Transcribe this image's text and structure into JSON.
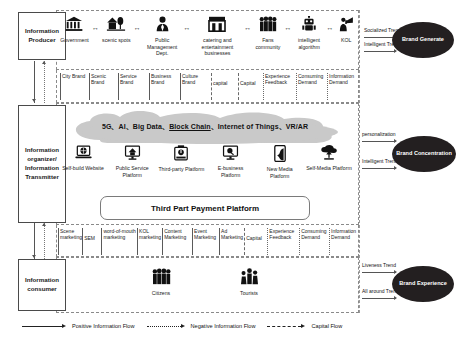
{
  "roles": {
    "producer": "Information Producer",
    "transmitter": "Information organizer/ Information Transmitter",
    "consumer": "Information consumer"
  },
  "producers": [
    {
      "label": "Government",
      "icon": "bank-icon",
      "glyph": "🏛"
    },
    {
      "label": "scenic spots",
      "icon": "park-icon",
      "glyph": "🏡"
    },
    {
      "label": "Public Management Dept.",
      "icon": "official-person-icon",
      "glyph": "👔"
    },
    {
      "label": "catering and entertainment businesses",
      "icon": "store-icon",
      "glyph": "🏪"
    },
    {
      "label": "Fans community",
      "icon": "people-group-icon",
      "glyph": "👥"
    },
    {
      "label": "intelligent algorithm",
      "icon": "robot-icon",
      "glyph": "🤖"
    },
    {
      "label": "KOL",
      "icon": "megaphone-person-icon",
      "glyph": "📢"
    }
  ],
  "upper_channels": [
    {
      "label": "City Brand",
      "flow": "solid"
    },
    {
      "label": "Scenic Brand",
      "flow": "solid"
    },
    {
      "label": "Service Brand",
      "flow": "solid"
    },
    {
      "label": "Business Brand",
      "flow": "solid"
    },
    {
      "label": "Culture Brand",
      "flow": "solid"
    },
    {
      "label": "capital",
      "flow": "dashdot"
    },
    {
      "label": "Capital",
      "flow": "dashdot"
    },
    {
      "label": "Experience Feedback",
      "flow": "dotted"
    },
    {
      "label": "Consuming Demand",
      "flow": "dotted"
    },
    {
      "label": "Information Demand",
      "flow": "dotted"
    }
  ],
  "cloud": {
    "text": "5G、AI、Big Data、Block Chain、Internet of Things、VR/AR",
    "parts": [
      "5G、AI、Big Data、",
      "Block Chain",
      "、Internet of Things、VR/AR"
    ]
  },
  "platforms": [
    {
      "label": "Self-build Website",
      "icon": "laptop-globe-icon",
      "glyph": "💻"
    },
    {
      "label": "Public Service Platform",
      "icon": "monitor-home-icon",
      "glyph": "🖥"
    },
    {
      "label": "Third-party Platform",
      "icon": "tablet-app-icon",
      "glyph": "📱"
    },
    {
      "label": "E-business Platform",
      "icon": "monitor-search-icon",
      "glyph": "🖥"
    },
    {
      "label": "New Media Platform",
      "icon": "smartphone-icon",
      "glyph": "📱"
    },
    {
      "label": "Self-Media Platform",
      "icon": "cloud-upload-icon",
      "glyph": "☁"
    }
  ],
  "payment_platform": "Third Part Payment Platform",
  "lower_channels": [
    {
      "label": "Scene marketing",
      "flow": "solid"
    },
    {
      "label": "SEM",
      "flow": "solid"
    },
    {
      "label": "word-of-mouth marketing",
      "flow": "solid"
    },
    {
      "label": "KOL marketing",
      "flow": "solid"
    },
    {
      "label": "Content Marketing",
      "flow": "solid"
    },
    {
      "label": "Event Marketing",
      "flow": "solid"
    },
    {
      "label": "Ad Marketing",
      "flow": "solid"
    },
    {
      "label": "Capital",
      "flow": "dashdot"
    },
    {
      "label": "Experience Feedback",
      "flow": "dotted"
    },
    {
      "label": "Consuming Demand",
      "flow": "dotted"
    },
    {
      "label": "Information Demand",
      "flow": "dotted"
    }
  ],
  "consumers": [
    {
      "label": "Citizens",
      "icon": "people-group-icon",
      "glyph": "👥"
    },
    {
      "label": "Tourists",
      "icon": "tourist-group-icon",
      "glyph": "👪"
    }
  ],
  "outcomes": [
    {
      "title": "Brand Generate",
      "top_label": "Socialized Trend",
      "bottom_label": "Intelligent Trend"
    },
    {
      "title": "Brand Concentration",
      "top_label": "personalization",
      "bottom_label": "Intelligent Trend"
    },
    {
      "title": "Brand Experience",
      "top_label": "Liveness Trend",
      "bottom_label": "All around Trend"
    }
  ],
  "legend": [
    {
      "label": "Positive Information Flow",
      "style": "solid"
    },
    {
      "label": "Negative Information Flow",
      "style": "dotted"
    },
    {
      "label": "Capital Flow",
      "style": "dashdot"
    }
  ],
  "colors": {
    "ellipse_fill": "#231f20",
    "cloud_fill": "#c9c9c9",
    "frame_stroke": "#8a8a8a",
    "box_stroke": "#4a4a4a"
  }
}
